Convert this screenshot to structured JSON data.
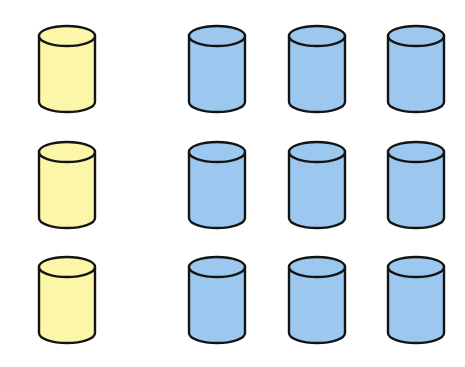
{
  "diagram": {
    "colors": {
      "yellow_fill": "#fbf6a8",
      "blue_fill": "#9cc8f0",
      "outline": "#141414"
    },
    "columns": [
      {
        "id": "yellow",
        "color": "yellow",
        "x": 37
      },
      {
        "id": "blue-1",
        "color": "blue",
        "x": 187
      },
      {
        "id": "blue-2",
        "color": "blue",
        "x": 287
      },
      {
        "id": "blue-3",
        "color": "blue",
        "x": 386
      }
    ],
    "rows": [
      {
        "y": 24
      },
      {
        "y": 140
      },
      {
        "y": 255
      }
    ],
    "cylinders": [
      {
        "row": 1,
        "col": "yellow",
        "color": "yellow"
      },
      {
        "row": 1,
        "col": "blue-1",
        "color": "blue"
      },
      {
        "row": 1,
        "col": "blue-2",
        "color": "blue"
      },
      {
        "row": 1,
        "col": "blue-3",
        "color": "blue"
      },
      {
        "row": 2,
        "col": "yellow",
        "color": "yellow"
      },
      {
        "row": 2,
        "col": "blue-1",
        "color": "blue"
      },
      {
        "row": 2,
        "col": "blue-2",
        "color": "blue"
      },
      {
        "row": 2,
        "col": "blue-3",
        "color": "blue"
      },
      {
        "row": 3,
        "col": "yellow",
        "color": "yellow"
      },
      {
        "row": 3,
        "col": "blue-1",
        "color": "blue"
      },
      {
        "row": 3,
        "col": "blue-2",
        "color": "blue"
      },
      {
        "row": 3,
        "col": "blue-3",
        "color": "blue"
      }
    ]
  }
}
